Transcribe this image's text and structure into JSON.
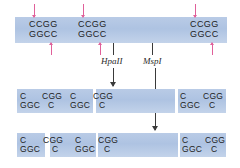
{
  "figure": {
    "colors": {
      "dna_bar": "#b4c7e4",
      "cut_arrow": "#e0609a",
      "enzyme_arrow": "#3a3a3a",
      "text": "#1c1c1c",
      "background": "#ffffff"
    }
  },
  "enzymes": {
    "hpaII": "HpaII",
    "mspI": "MspI"
  },
  "top_duplex": {
    "sites": [
      {
        "top": "CCGG",
        "bottom": "GGCC"
      },
      {
        "top": "CCGG",
        "bottom": "GGCC"
      },
      {
        "top": "CCGG",
        "bottom": "GGCC"
      }
    ]
  },
  "hpaII_fragments": [
    {
      "top": "C",
      "bottom": "GGC"
    },
    {
      "top": "CGG",
      "bottom": "C"
    },
    {
      "top": "C",
      "bottom": "GGC"
    },
    {
      "top": "CGG",
      "bottom": "C"
    },
    {
      "top": "C",
      "bottom": "GGC"
    },
    {
      "top": "CGG",
      "bottom": "C"
    }
  ],
  "mspI_fragments": [
    {
      "top": "C",
      "bottom": "GGC"
    },
    {
      "top": "CGG",
      "bottom": "C"
    },
    {
      "top": "C",
      "bottom": "GGC"
    },
    {
      "top": "CGG",
      "bottom": "C"
    },
    {
      "top": "C",
      "bottom": "GGC"
    },
    {
      "top": "CGG",
      "bottom": "C"
    }
  ]
}
